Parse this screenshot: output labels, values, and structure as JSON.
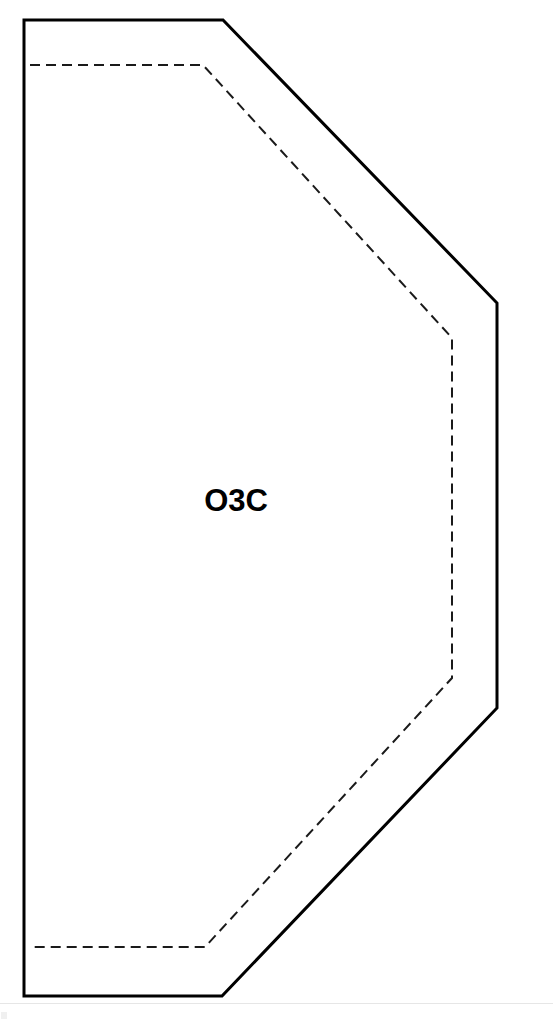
{
  "document": {
    "title": "O3C Panel Drawing",
    "background_color": "#ffffff"
  },
  "drawing": {
    "label": "O3C",
    "label_position": {
      "x": 236,
      "y": 511
    },
    "stroke_color": "#000000",
    "fold_line_color": "#1a1a1a",
    "fill_color": "#ffffff",
    "outer_stroke_width": 3,
    "inner_stroke_width": 2,
    "dash_pattern": "10 6",
    "outer_outline_points": "24,20 223,20 497,303 497,708 222,996 24,996",
    "inner_outline_points": "30,65 203,65 452,338 452,678 205,947 30,947",
    "shape_description": "hexagonal panel outline with dashed inner fold line"
  },
  "page": {
    "footer_rule_color": "#e6e6e6",
    "footer_mark_color": "#f0f0f0"
  }
}
